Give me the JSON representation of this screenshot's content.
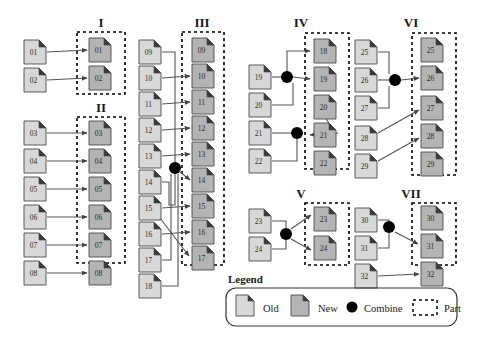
{
  "figure": {
    "colors": {
      "old_fill": "#d8d8d8",
      "new_fill": "#b4b4b4",
      "doc_stroke": "#4a4a4a",
      "fold": "#3a3a3a",
      "combine": "#000000",
      "part_dash": "#000000",
      "line": "#555555",
      "text": "#1a1a1a",
      "background": "#ffffff"
    },
    "doc": {
      "width": 22,
      "height": 24,
      "fold": 7
    }
  },
  "groups": [
    {
      "id": "I",
      "label": "I",
      "label_x": 101,
      "label_y": 27,
      "part_box": {
        "x": 77,
        "y": 32,
        "w": 48,
        "h": 62
      },
      "old_docs": [
        {
          "id": "01",
          "label": "01",
          "x": 24,
          "y": 40
        },
        {
          "id": "02",
          "label": "02",
          "x": 24,
          "y": 68
        }
      ],
      "new_docs": [
        {
          "id": "01n",
          "label": "01",
          "x": 89,
          "y": 38
        },
        {
          "id": "02n",
          "label": "02",
          "x": 89,
          "y": 66
        }
      ],
      "arrows": [
        {
          "from": "01",
          "to": "01n",
          "type": "straight",
          "x1": 47,
          "y1": 52,
          "x2": 87,
          "y2": 50
        },
        {
          "from": "02",
          "to": "02n",
          "type": "straight",
          "x1": 47,
          "y1": 80,
          "x2": 87,
          "y2": 78
        }
      ],
      "combines": []
    },
    {
      "id": "II",
      "label": "II",
      "label_x": 101,
      "label_y": 112,
      "part_box": {
        "x": 77,
        "y": 117,
        "w": 48,
        "h": 146
      },
      "old_docs": [
        {
          "id": "03",
          "label": "03",
          "x": 24,
          "y": 121
        },
        {
          "id": "04",
          "label": "04",
          "x": 24,
          "y": 149
        },
        {
          "id": "05",
          "label": "05",
          "x": 24,
          "y": 177
        },
        {
          "id": "06",
          "label": "06",
          "x": 24,
          "y": 205
        },
        {
          "id": "07",
          "label": "07",
          "x": 24,
          "y": 233
        },
        {
          "id": "08",
          "label": "08",
          "x": 24,
          "y": 261
        }
      ],
      "new_docs": [
        {
          "id": "03n",
          "label": "03",
          "x": 89,
          "y": 121
        },
        {
          "id": "04n",
          "label": "04",
          "x": 89,
          "y": 149
        },
        {
          "id": "05n",
          "label": "05",
          "x": 89,
          "y": 177
        },
        {
          "id": "06n",
          "label": "06",
          "x": 89,
          "y": 205
        },
        {
          "id": "07n",
          "label": "07",
          "x": 89,
          "y": 233
        },
        {
          "id": "08n",
          "label": "08",
          "x": 89,
          "y": 261
        }
      ],
      "arrows": [
        {
          "from": "03",
          "to": "03n",
          "type": "straight",
          "x1": 47,
          "y1": 133,
          "x2": 87,
          "y2": 133
        },
        {
          "from": "04",
          "to": "04n",
          "type": "straight",
          "x1": 47,
          "y1": 161,
          "x2": 87,
          "y2": 161
        },
        {
          "from": "05",
          "to": "05n",
          "type": "straight",
          "x1": 47,
          "y1": 189,
          "x2": 87,
          "y2": 189
        },
        {
          "from": "06",
          "to": "06n",
          "type": "straight",
          "x1": 47,
          "y1": 217,
          "x2": 87,
          "y2": 217
        },
        {
          "from": "07",
          "to": "07n",
          "type": "straight",
          "x1": 47,
          "y1": 245,
          "x2": 87,
          "y2": 245
        },
        {
          "from": "08",
          "to": "08n",
          "type": "straight",
          "x1": 47,
          "y1": 273,
          "x2": 87,
          "y2": 273
        }
      ],
      "combines": []
    },
    {
      "id": "III",
      "label": "III",
      "label_x": 202,
      "label_y": 27,
      "part_box": {
        "x": 182,
        "y": 32,
        "w": 42,
        "h": 233
      },
      "old_docs": [
        {
          "id": "09",
          "label": "09",
          "x": 139,
          "y": 40
        },
        {
          "id": "10",
          "label": "10",
          "x": 139,
          "y": 66
        },
        {
          "id": "11",
          "label": "11",
          "x": 139,
          "y": 92
        },
        {
          "id": "12",
          "label": "12",
          "x": 139,
          "y": 118
        },
        {
          "id": "13",
          "label": "13",
          "x": 139,
          "y": 144
        },
        {
          "id": "14",
          "label": "14",
          "x": 139,
          "y": 170
        },
        {
          "id": "15",
          "label": "15",
          "x": 139,
          "y": 196
        },
        {
          "id": "16",
          "label": "16",
          "x": 139,
          "y": 222
        },
        {
          "id": "17",
          "label": "17",
          "x": 139,
          "y": 248
        },
        {
          "id": "18",
          "label": "18",
          "x": 139,
          "y": 274
        }
      ],
      "new_docs": [
        {
          "id": "09n",
          "label": "09",
          "x": 192,
          "y": 38
        },
        {
          "id": "10n",
          "label": "10",
          "x": 192,
          "y": 64
        },
        {
          "id": "11n",
          "label": "11",
          "x": 192,
          "y": 90
        },
        {
          "id": "12n",
          "label": "12",
          "x": 192,
          "y": 116
        },
        {
          "id": "13n",
          "label": "13",
          "x": 192,
          "y": 142
        },
        {
          "id": "14n",
          "label": "14",
          "x": 192,
          "y": 168
        },
        {
          "id": "15n",
          "label": "15",
          "x": 192,
          "y": 194
        },
        {
          "id": "16n",
          "label": "16",
          "x": 192,
          "y": 220
        },
        {
          "id": "17n",
          "label": "17",
          "x": 192,
          "y": 246
        }
      ],
      "arrows": [
        {
          "from": "10",
          "to": "10n",
          "type": "straight",
          "x1": 162,
          "y1": 78,
          "x2": 190,
          "y2": 76
        },
        {
          "from": "11",
          "to": "11n",
          "type": "straight",
          "x1": 162,
          "y1": 104,
          "x2": 190,
          "y2": 102
        },
        {
          "from": "12",
          "to": "12n",
          "type": "straight",
          "x1": 162,
          "y1": 130,
          "x2": 190,
          "y2": 128
        },
        {
          "from": "13",
          "to": "13n",
          "type": "straight",
          "x1": 162,
          "y1": 156,
          "x2": 190,
          "y2": 154
        },
        {
          "from": "15",
          "to": "15n",
          "type": "straight",
          "x1": 162,
          "y1": 208,
          "x2": 190,
          "y2": 206
        },
        {
          "from": "16",
          "to": "16n",
          "type": "straight",
          "x1": 162,
          "y1": 234,
          "x2": 190,
          "y2": 232
        },
        {
          "from": "15",
          "to": "17n",
          "type": "diagonal",
          "x1": 150,
          "y1": 205,
          "x2": 189,
          "y2": 256
        },
        {
          "from": "combine-1",
          "to": "14n",
          "type": "diagonal",
          "x1": 180,
          "y1": 172,
          "x2": 190,
          "y2": 180
        }
      ],
      "combines": [
        {
          "id": "combine-1",
          "x": 175,
          "y": 168,
          "r": 6,
          "inputs": [
            "09",
            "14",
            "16",
            "18"
          ],
          "outputs": [
            "14n"
          ],
          "feeders": [
            {
              "from": "09",
              "path": "M162,52 L175,52 L175,162"
            },
            {
              "from": "14",
              "path": "M162,182 L169,182 L169,205 L175,205 L175,174"
            },
            {
              "from": "17",
              "path": "M162,260 L171,260 L171,174"
            },
            {
              "from": "18",
              "path": "M162,286 L178,286 L178,174"
            }
          ]
        }
      ]
    },
    {
      "id": "IV",
      "label": "IV",
      "label_x": 301,
      "label_y": 27,
      "part_box": {
        "x": 305,
        "y": 33,
        "w": 44,
        "h": 136
      },
      "old_docs": [
        {
          "id": "19",
          "label": "19",
          "x": 249,
          "y": 65
        },
        {
          "id": "20",
          "label": "20",
          "x": 249,
          "y": 93
        },
        {
          "id": "21",
          "label": "21",
          "x": 249,
          "y": 121
        },
        {
          "id": "22",
          "label": "22",
          "x": 249,
          "y": 149
        }
      ],
      "new_docs": [
        {
          "id": "18n",
          "label": "18",
          "x": 314,
          "y": 39
        },
        {
          "id": "19n",
          "label": "19",
          "x": 314,
          "y": 67
        },
        {
          "id": "20n",
          "label": "20",
          "x": 314,
          "y": 95
        },
        {
          "id": "21n",
          "label": "21",
          "x": 314,
          "y": 123
        },
        {
          "id": "22n",
          "label": "22",
          "x": 314,
          "y": 151
        }
      ],
      "arrows": [
        {
          "from": "combine-2",
          "to": "18n",
          "type": "elbow",
          "path": "M287,77 L287,51 L310,51"
        },
        {
          "from": "combine-2",
          "to": "19n",
          "type": "straight",
          "x1": 293,
          "y1": 77,
          "x2": 310,
          "y2": 79
        },
        {
          "from": "combine-3",
          "to": "20n",
          "type": "diagonal",
          "x1": 332,
          "y1": 128,
          "x2": 318,
          "y2": 106
        },
        {
          "from": "combine-3",
          "to": "21n",
          "type": "straight",
          "x1": 338,
          "y1": 133,
          "x2": 310,
          "y2": 135
        }
      ],
      "combines": [
        {
          "id": "combine-2",
          "x": 287,
          "y": 77,
          "r": 6,
          "inputs": [
            "19",
            "20"
          ],
          "outputs": [
            "18n",
            "19n"
          ],
          "feeders": [
            {
              "from": "19",
              "path": "M272,77 L281,77"
            },
            {
              "from": "20",
              "path": "M272,105 L293,105 L293,83"
            }
          ]
        },
        {
          "id": "combine-3",
          "x": 297,
          "y": 133,
          "r": 6,
          "inputs": [
            "21",
            "22"
          ],
          "outputs": [
            "20n",
            "21n"
          ],
          "feeders": [
            {
              "from": "21",
              "path": "M272,133 L291,133"
            },
            {
              "from": "22",
              "path": "M272,161 L297,161 L297,139"
            }
          ]
        }
      ]
    },
    {
      "id": "V",
      "label": "V",
      "label_x": 301,
      "label_y": 198,
      "part_box": {
        "x": 305,
        "y": 203,
        "w": 44,
        "h": 62
      },
      "old_docs": [
        {
          "id": "23",
          "label": "23",
          "x": 249,
          "y": 209
        },
        {
          "id": "24",
          "label": "24",
          "x": 249,
          "y": 237
        }
      ],
      "new_docs": [
        {
          "id": "23n",
          "label": "23",
          "x": 314,
          "y": 207
        },
        {
          "id": "24n",
          "label": "24",
          "x": 314,
          "y": 236
        }
      ],
      "arrows": [
        {
          "from": "combine-4",
          "to": "23n",
          "type": "diagonal",
          "x1": 291,
          "y1": 229,
          "x2": 311,
          "y2": 215
        },
        {
          "from": "combine-4",
          "to": "24n",
          "type": "diagonal",
          "x1": 291,
          "y1": 239,
          "x2": 311,
          "y2": 250
        }
      ],
      "combines": [
        {
          "id": "combine-4",
          "x": 286,
          "y": 234,
          "r": 6,
          "inputs": [
            "23",
            "24"
          ],
          "outputs": [
            "23n",
            "24n"
          ],
          "feeders": [
            {
              "from": "23",
              "path": "M272,221 L286,221 L286,228"
            },
            {
              "from": "24",
              "path": "M272,249 L286,249 L286,240"
            }
          ]
        }
      ]
    },
    {
      "id": "VI",
      "label": "VI",
      "label_x": 411,
      "label_y": 27,
      "part_box": {
        "x": 412,
        "y": 33,
        "w": 44,
        "h": 142
      },
      "old_docs": [
        {
          "id": "25",
          "label": "25",
          "x": 355,
          "y": 40
        },
        {
          "id": "26",
          "label": "26",
          "x": 355,
          "y": 68
        },
        {
          "id": "27",
          "label": "27",
          "x": 355,
          "y": 96
        },
        {
          "id": "28",
          "label": "28",
          "x": 355,
          "y": 126
        },
        {
          "id": "29",
          "label": "29",
          "x": 355,
          "y": 154
        }
      ],
      "new_docs": [
        {
          "id": "25n",
          "label": "25",
          "x": 421,
          "y": 38
        },
        {
          "id": "26n",
          "label": "26",
          "x": 421,
          "y": 66
        },
        {
          "id": "27n",
          "label": "27",
          "x": 421,
          "y": 96
        },
        {
          "id": "28n",
          "label": "28",
          "x": 421,
          "y": 124
        },
        {
          "id": "29n",
          "label": "29",
          "x": 421,
          "y": 152
        }
      ],
      "arrows": [
        {
          "from": "combine-5",
          "to": "26n",
          "type": "straight",
          "x1": 401,
          "y1": 80,
          "x2": 419,
          "y2": 78
        },
        {
          "from": "28",
          "to": "27n",
          "type": "diagonal",
          "x1": 378,
          "y1": 133,
          "x2": 419,
          "y2": 110
        },
        {
          "from": "29",
          "to": "28n",
          "type": "diagonal",
          "x1": 378,
          "y1": 161,
          "x2": 419,
          "y2": 138
        }
      ],
      "combines": [
        {
          "id": "combine-5",
          "x": 395,
          "y": 80,
          "r": 6,
          "inputs": [
            "25",
            "26",
            "27"
          ],
          "outputs": [
            "26n"
          ],
          "feeders": [
            {
              "from": "25",
              "path": "M378,52 L389,52 L389,74"
            },
            {
              "from": "26",
              "path": "M378,80 L389,80"
            },
            {
              "from": "27",
              "path": "M378,108 L389,108 L389,86"
            }
          ]
        }
      ]
    },
    {
      "id": "VII",
      "label": "VII",
      "label_x": 411,
      "label_y": 198,
      "part_box": {
        "x": 412,
        "y": 203,
        "w": 44,
        "h": 62
      },
      "old_docs": [
        {
          "id": "30",
          "label": "30",
          "x": 355,
          "y": 208
        },
        {
          "id": "31",
          "label": "31",
          "x": 355,
          "y": 236
        },
        {
          "id": "32",
          "label": "32",
          "x": 355,
          "y": 264
        }
      ],
      "new_docs": [
        {
          "id": "30n",
          "label": "30",
          "x": 421,
          "y": 206
        },
        {
          "id": "31n",
          "label": "31",
          "x": 421,
          "y": 234
        },
        {
          "id": "32n",
          "label": "32",
          "x": 421,
          "y": 262
        }
      ],
      "arrows": [
        {
          "from": "combine-6",
          "to": "31n",
          "type": "diagonal",
          "x1": 395,
          "y1": 232,
          "x2": 418,
          "y2": 244
        },
        {
          "from": "32",
          "to": "32n",
          "type": "straight",
          "x1": 378,
          "y1": 276,
          "x2": 419,
          "y2": 274
        }
      ],
      "combines": [
        {
          "id": "combine-6",
          "x": 389,
          "y": 227,
          "r": 6,
          "inputs": [
            "30",
            "31"
          ],
          "outputs": [
            "31n"
          ],
          "feeders": [
            {
              "from": "30",
              "path": "M378,220 L389,220 L389,221"
            },
            {
              "from": "31",
              "path": "M378,248 L389,248 L389,233"
            }
          ]
        }
      ]
    }
  ],
  "legend": {
    "title": "Legend",
    "title_x": 228,
    "title_y": 283,
    "box": {
      "x": 226,
      "y": 288,
      "w": 231,
      "h": 38,
      "radius": 10
    },
    "items": [
      {
        "key": "old",
        "label": "Old",
        "icon": "document-old-icon",
        "icon_x": 236,
        "icon_y": 295,
        "label_x": 263,
        "label_y": 312
      },
      {
        "key": "new",
        "label": "New",
        "icon": "document-new-icon",
        "icon_x": 291,
        "icon_y": 295,
        "label_x": 318,
        "label_y": 312
      },
      {
        "key": "combine",
        "label": "Combine",
        "icon": "combine-dot-icon",
        "icon_x": 352,
        "icon_y": 307,
        "label_x": 364,
        "label_y": 312
      },
      {
        "key": "part",
        "label": "Part",
        "icon": "part-dashed-box-icon",
        "icon_x": 413,
        "icon_y": 300,
        "label_x": 444,
        "label_y": 312
      }
    ]
  }
}
